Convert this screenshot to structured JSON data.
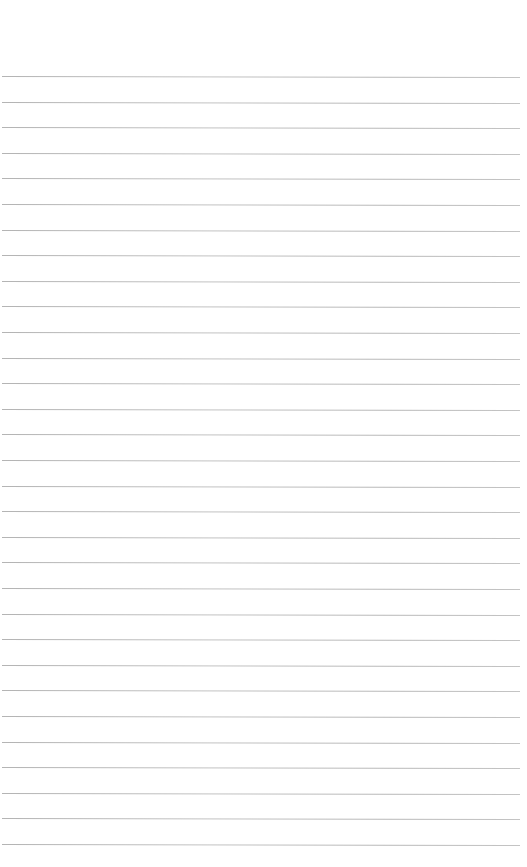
{
  "page": {
    "type": "lined-paper",
    "background_color": "#ffffff",
    "line_color": "#bdbdbd",
    "line_count": 31,
    "first_line_y": 76,
    "line_spacing": 25.6,
    "text": ""
  }
}
